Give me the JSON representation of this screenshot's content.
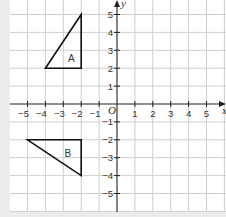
{
  "diagram": {
    "type": "coordinate-grid",
    "x_axis": {
      "label": "x",
      "range": [
        -5,
        5
      ],
      "ticks": [
        -5,
        -4,
        -3,
        -2,
        -1,
        1,
        2,
        3,
        4,
        5
      ]
    },
    "y_axis": {
      "label": "y",
      "range": [
        -5,
        5
      ],
      "ticks": [
        5,
        4,
        3,
        2,
        1,
        -1,
        -2,
        -3,
        -4,
        -5
      ]
    },
    "origin_label": "O",
    "shapes": [
      {
        "name": "A",
        "label": "A",
        "vertices": [
          [
            -4,
            2
          ],
          [
            -2,
            2
          ],
          [
            -2,
            5
          ]
        ],
        "label_at": [
          -2.55,
          2.55
        ]
      },
      {
        "name": "B",
        "label": "B",
        "vertices": [
          [
            -5,
            -2
          ],
          [
            -2,
            -2
          ],
          [
            -2,
            -4
          ]
        ],
        "label_at": [
          -2.75,
          -2.75
        ]
      }
    ],
    "colors": {
      "grid": "#cfcfcf",
      "axis": "#222222",
      "shape": "#111111",
      "panel": "#ffffff",
      "background": "#ececec"
    }
  }
}
